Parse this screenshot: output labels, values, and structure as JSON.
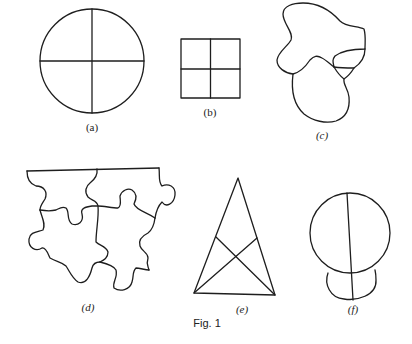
{
  "figure": {
    "caption": "Fig. 1",
    "stroke_color": "#1e1e1e",
    "background": "#ffffff",
    "panels": [
      {
        "id": "a",
        "label": "(a)",
        "description": "Circle divided into four regions by a vertical and a horizontal diameter"
      },
      {
        "id": "b",
        "label": "(b)",
        "description": "Square divided into four equal smaller squares"
      },
      {
        "id": "c",
        "label": "(c)",
        "description": "Irregular blob-shaped map with three/four adjacent regions"
      },
      {
        "id": "d",
        "label": "(d)",
        "description": "Four interlocking jigsaw puzzle pieces"
      },
      {
        "id": "e",
        "label": "(e)",
        "description": "Tall triangle divided by two crossing cevians from base vertices"
      },
      {
        "id": "f",
        "label": "(f)",
        "description": "Large circle overlapping a smaller circle below, both bisected by a near-vertical line"
      }
    ]
  }
}
